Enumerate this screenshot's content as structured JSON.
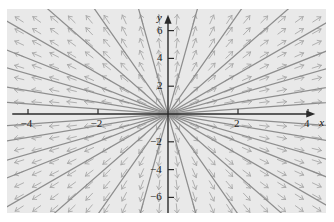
{
  "figure": {
    "background_color": "#ffffff",
    "plot_background_color": "#e9e9e9",
    "axis_color": "#2b2b2b",
    "field_color": "#a8a8a8",
    "curve_color": "#8a8a8a",
    "label_color": "#1b1b1b"
  },
  "axes": {
    "x_axis_name": "x",
    "y_axis_name": "y",
    "x_ticks": [
      {
        "value": -4,
        "label": "−4"
      },
      {
        "value": -2,
        "label": "−2"
      },
      {
        "value": 2,
        "label": "2"
      },
      {
        "value": 4,
        "label": "4"
      }
    ],
    "y_ticks": [
      {
        "value": 6,
        "label": "6"
      },
      {
        "value": 4,
        "label": "4"
      },
      {
        "value": 2,
        "label": "2"
      },
      {
        "value": -2,
        "label": "−2"
      },
      {
        "value": -4,
        "label": "−4"
      },
      {
        "value": -6,
        "label": "−6"
      }
    ]
  },
  "chart_data": {
    "type": "scatter",
    "title": "",
    "xlabel": "x",
    "ylabel": "y",
    "xlim": [
      -4.6,
      4.35
    ],
    "ylim": [
      -7.4,
      7.3
    ],
    "grid": false,
    "legend": null,
    "plot_kind": "direction-field",
    "equation": "dy/dx = y/x",
    "field": {
      "x_samples": [
        -4.25,
        -3.75,
        -3.25,
        -2.75,
        -2.25,
        -1.75,
        -1.25,
        -0.75,
        -0.25,
        0.25,
        0.75,
        1.25,
        1.75,
        2.25,
        2.75,
        3.25,
        3.75,
        4.25
      ],
      "y_samples": [
        6.8,
        5.95,
        5.1,
        4.25,
        3.4,
        2.55,
        1.7,
        0.85,
        -0.85,
        -1.7,
        -2.55,
        -3.4,
        -4.25,
        -5.1,
        -5.95,
        -6.8
      ],
      "vector_rule": "u = x, v = y (normalized, arrowhead at tip pointing radially outward)"
    },
    "solution_curves": {
      "description": "Straight lines y = m x through the origin (isoclines of the radial field)",
      "slopes": [
        0.18,
        0.42,
        0.72,
        1.0,
        1.45,
        2.2,
        3.6,
        9.0,
        -0.18,
        -0.42,
        -0.72,
        -1.0,
        -1.45,
        -2.2,
        -3.6,
        -9.0
      ]
    }
  }
}
